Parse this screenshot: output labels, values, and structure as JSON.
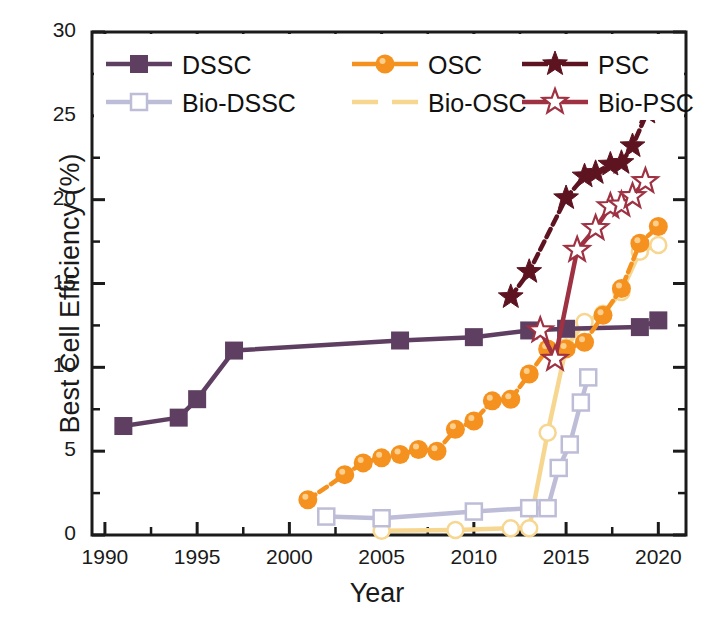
{
  "chart_data": {
    "type": "line",
    "title": "",
    "xlabel": "Year",
    "ylabel": "Best Cell Efficiency (%)",
    "xlim": [
      1989.3,
      2021.5
    ],
    "ylim": [
      0,
      30
    ],
    "xticks": [
      1990,
      1995,
      2000,
      2005,
      2010,
      2015,
      2020
    ],
    "xtick_labels": [
      "1990",
      "1995",
      "2000",
      "2005",
      "2010",
      "2015",
      "2020"
    ],
    "yticks": [
      0,
      5,
      10,
      15,
      20,
      25,
      30
    ],
    "ytick_labels": [
      "0",
      "5",
      "10",
      "15",
      "20",
      "25",
      "30"
    ],
    "minor_x_interval": 2.5,
    "minor_y_interval": 2.5,
    "grid": false,
    "legend_position": "top-left-inside",
    "series": [
      {
        "name": "DSSC",
        "color": "#5E3F62",
        "marker": "filled-square",
        "linestyle": "solid",
        "x": [
          1991,
          1994,
          1995,
          1997,
          2006,
          2010,
          2013,
          2015,
          2019,
          2020
        ],
        "y": [
          6.5,
          7.0,
          8.1,
          11.0,
          11.6,
          11.8,
          12.2,
          12.3,
          12.4,
          12.8
        ]
      },
      {
        "name": "OSC",
        "color": "#F5911E",
        "marker": "filled-circle",
        "linestyle": "dashed",
        "x": [
          2001,
          2003,
          2004,
          2005,
          2006,
          2007,
          2008,
          2009,
          2010,
          2011,
          2012,
          2013,
          2014,
          2015,
          2016,
          2017,
          2018,
          2019,
          2020
        ],
        "y": [
          2.1,
          3.6,
          4.3,
          4.6,
          4.8,
          5.1,
          5.0,
          6.3,
          6.8,
          8.0,
          8.1,
          9.6,
          11.1,
          11.1,
          11.5,
          13.1,
          14.7,
          17.4,
          18.4
        ]
      },
      {
        "name": "PSC",
        "color": "#5E1420",
        "marker": "filled-star",
        "linestyle": "dashed",
        "x": [
          2012,
          2013,
          2015,
          2016,
          2016.6,
          2017.4,
          2018,
          2018.6,
          2019.4,
          2020
        ],
        "y": [
          14.2,
          15.7,
          20.1,
          21.4,
          21.6,
          22.1,
          22.2,
          23.2,
          25.2,
          25.7
        ]
      },
      {
        "name": "Bio-DSSC",
        "color": "#BEBDD8",
        "marker": "open-square",
        "linestyle": "solid",
        "x": [
          2002,
          2005,
          2010,
          2013,
          2014,
          2014.6,
          2015.2,
          2015.8,
          2016.2
        ],
        "y": [
          1.1,
          1.0,
          1.4,
          1.6,
          1.6,
          4.0,
          5.4,
          7.9,
          9.4
        ]
      },
      {
        "name": "Bio-OSC",
        "color": "#F7D690",
        "marker": "open-circle",
        "linestyle": "solid",
        "x": [
          2005,
          2009,
          2012,
          2013,
          2014,
          2015,
          2016,
          2017,
          2018,
          2019,
          2020
        ],
        "y": [
          0.25,
          0.3,
          0.4,
          0.4,
          6.1,
          11.2,
          12.7,
          13.2,
          14.5,
          16.9,
          17.3
        ]
      },
      {
        "name": "Bio-PSC",
        "color": "#9E3142",
        "marker": "open-star",
        "linestyle": "solid",
        "x": [
          2013.6,
          2014.4,
          2015.6,
          2016.6,
          2017.4,
          2018,
          2018.6,
          2019.3
        ],
        "y": [
          12.2,
          10.5,
          17.0,
          18.3,
          19.6,
          19.7,
          20.2,
          21.1
        ]
      }
    ],
    "legend": [
      {
        "label": "DSSC",
        "color": "#5E3F62",
        "marker": "filled-square"
      },
      {
        "label": "OSC",
        "color": "#F5911E",
        "marker": "filled-circle"
      },
      {
        "label": "PSC",
        "color": "#5E1420",
        "marker": "filled-star"
      },
      {
        "label": "Bio-DSSC",
        "color": "#BEBDD8",
        "marker": "open-square"
      },
      {
        "label": "Bio-OSC",
        "color": "#F7D690",
        "marker": "open-line"
      },
      {
        "label": "Bio-PSC",
        "color": "#9E3142",
        "marker": "open-star"
      }
    ]
  }
}
